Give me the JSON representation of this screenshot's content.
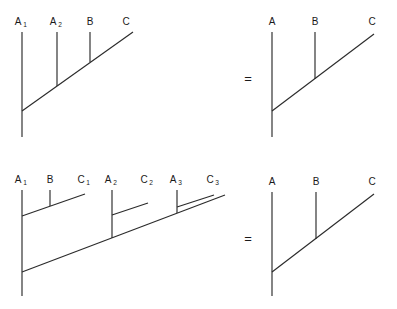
{
  "figure": {
    "stroke_color": "#2b2b2b",
    "text_color": "#1a1a1a",
    "background_color": "#ffffff",
    "equality_symbol": "="
  },
  "rows": [
    {
      "id": "row-top",
      "left_diagram": {
        "id": "top-left-tree",
        "labels": [
          {
            "base": "A",
            "sub": "1"
          },
          {
            "base": "A",
            "sub": "2"
          },
          {
            "base": "B",
            "sub": ""
          },
          {
            "base": "C",
            "sub": ""
          }
        ]
      },
      "equals": "=",
      "right_diagram": {
        "id": "top-right-tree",
        "labels": [
          {
            "base": "A",
            "sub": ""
          },
          {
            "base": "B",
            "sub": ""
          },
          {
            "base": "C",
            "sub": ""
          }
        ]
      }
    },
    {
      "id": "row-bottom",
      "left_diagram": {
        "id": "bottom-left-tree",
        "labels": [
          {
            "base": "A",
            "sub": "1"
          },
          {
            "base": "B",
            "sub": ""
          },
          {
            "base": "C",
            "sub": "1"
          },
          {
            "base": "A",
            "sub": "2"
          },
          {
            "base": "C",
            "sub": "2"
          },
          {
            "base": "A",
            "sub": "3"
          },
          {
            "base": "C",
            "sub": "3"
          }
        ]
      },
      "equals": "=",
      "right_diagram": {
        "id": "bottom-right-tree",
        "labels": [
          {
            "base": "A",
            "sub": ""
          },
          {
            "base": "B",
            "sub": ""
          },
          {
            "base": "C",
            "sub": ""
          }
        ]
      }
    }
  ]
}
